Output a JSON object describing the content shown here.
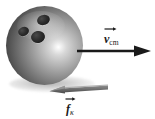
{
  "figure": {
    "name": "rolling-bowling-ball-free-body-figure",
    "background_color": "#ffffff",
    "width": 155,
    "height": 119
  },
  "object": {
    "name": "bowling-ball",
    "holes_count": 3,
    "body_color_light": "#ffffff",
    "body_color_mid": "#9e9e9e",
    "body_color_dark": "#2a2a2a",
    "hole_color": "#141414",
    "shadow_color": "#9a9a9a"
  },
  "vectors": [
    {
      "name": "velocity-vector",
      "symbol": "v",
      "subscript": "cm",
      "direction": "right",
      "color": "#1a1a1a",
      "tail": {
        "x": 78,
        "y": 51
      },
      "head": {
        "x": 150,
        "y": 51
      }
    },
    {
      "name": "friction-force-vector",
      "symbol": "f",
      "subscript": "κ",
      "direction": "left",
      "color": "#6e6e6e",
      "tail": {
        "x": 108,
        "y": 88
      },
      "head": {
        "x": 50,
        "y": 92
      }
    }
  ],
  "labels": {
    "velocity": {
      "symbol": "v",
      "subscript": "cm",
      "overbar": "arrow",
      "text": "v⃗cm"
    },
    "friction": {
      "symbol": "f",
      "subscript": "κ",
      "overbar": "arrow",
      "text": "f⃗κ"
    }
  }
}
